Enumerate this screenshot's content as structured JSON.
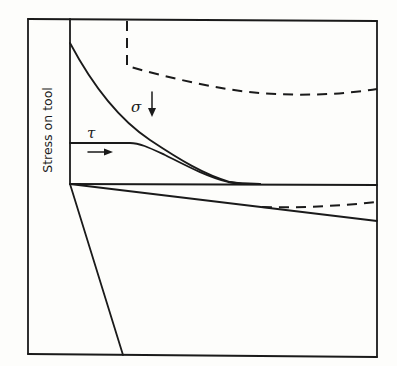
{
  "figure": {
    "y_axis_label": "Stress on tool",
    "symbols": {
      "normal_stress": "σ",
      "shear_stress": "τ"
    },
    "colors": {
      "ink": "#1a1a1a",
      "paper": "#fdfdfb"
    }
  },
  "diagram_elements": [
    {
      "name": "outer-frame",
      "type": "rectangle"
    },
    {
      "name": "tool-rake-face",
      "type": "vertical line"
    },
    {
      "name": "baseline",
      "type": "horizontal line"
    },
    {
      "name": "normal-stress-curve",
      "label": "σ",
      "style": "solid",
      "direction_arrow": "down"
    },
    {
      "name": "shear-stress-curve",
      "label": "τ",
      "style": "solid",
      "direction_arrow": "right"
    },
    {
      "name": "upper-dashed-curve",
      "style": "dashed"
    },
    {
      "name": "tool-flank-line",
      "style": "solid"
    },
    {
      "name": "lower-dashed-segment",
      "style": "dashed"
    },
    {
      "name": "tool-clearance-line",
      "style": "solid"
    }
  ]
}
